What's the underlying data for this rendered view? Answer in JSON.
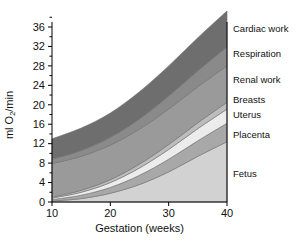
{
  "chart_data": {
    "type": "area",
    "title": "",
    "xlabel": "Gestation (weeks)",
    "ylabel": "ml O2/min",
    "ylabel_parts": {
      "pre": "ml O",
      "sub": "2",
      "post": "/min"
    },
    "x": [
      10,
      15,
      20,
      25,
      30,
      35,
      40
    ],
    "xlim": [
      10,
      40
    ],
    "ylim": [
      0,
      40
    ],
    "xticks": [
      10,
      20,
      30,
      40
    ],
    "xtick_labels": [
      "10",
      "20",
      "30",
      "40"
    ],
    "yticks": [
      0,
      4,
      8,
      12,
      16,
      20,
      24,
      28,
      32,
      36
    ],
    "ytick_labels": [
      "0",
      "4",
      "8",
      "12",
      "16",
      "20",
      "24",
      "28",
      "32",
      "36"
    ],
    "yminor_ticks": [
      2,
      6,
      10,
      14,
      18,
      22,
      26,
      30,
      34,
      38
    ],
    "grid": false,
    "legend_position": "right-outside",
    "stacked": true,
    "stack_order_bottom_to_top": [
      "Fetus",
      "Placenta",
      "Uterus",
      "Breasts",
      "Renal work",
      "Respiration",
      "Cardiac work"
    ],
    "series": [
      {
        "name": "Fetus",
        "color": "#d2d2d2",
        "label_y_value": 5.8,
        "values": [
          0.2,
          0.7,
          1.8,
          3.6,
          6.2,
          9.4,
          12.4
        ]
      },
      {
        "name": "Placenta",
        "color": "#a8a8a8",
        "label_y_value": 13.9,
        "values": [
          0.3,
          0.7,
          1.2,
          1.9,
          2.6,
          3.2,
          3.8
        ]
      },
      {
        "name": "Uterus",
        "color": "#ececec",
        "label_y_value": 18.0,
        "values": [
          0.3,
          0.6,
          1.0,
          1.5,
          2.0,
          2.5,
          2.9
        ]
      },
      {
        "name": "Breasts",
        "color": "#bdbdbd",
        "label_y_value": 21.1,
        "values": [
          0.2,
          0.4,
          0.6,
          0.8,
          1.0,
          1.2,
          1.4
        ]
      },
      {
        "name": "Renal work",
        "color": "#9a9a9a",
        "label_y_value": 25.1,
        "values": [
          6.9,
          7.0,
          7.1,
          7.2,
          7.3,
          7.4,
          7.5
        ]
      },
      {
        "name": "Respiration",
        "color": "#8a8a8a",
        "label_y_value": 30.6,
        "values": [
          0.9,
          1.2,
          1.6,
          2.1,
          2.7,
          3.3,
          3.9
        ]
      },
      {
        "name": "Cardiac work",
        "color": "#6e6e6e",
        "label_y_value": 35.6,
        "values": [
          4.2,
          4.6,
          5.0,
          5.6,
          6.2,
          6.8,
          7.4
        ]
      }
    ],
    "totals": [
      13.0,
      15.2,
      18.3,
      22.7,
      28.0,
      33.8,
      39.3
    ],
    "legend_entries": [
      {
        "label": "Cardiac work"
      },
      {
        "label": "Respiration"
      },
      {
        "label": "Renal work"
      },
      {
        "label": "Breasts"
      },
      {
        "label": "Uterus"
      },
      {
        "label": "Placenta"
      },
      {
        "label": "Fetus"
      }
    ]
  },
  "colors": {
    "axis": "#000000",
    "text": "#111111",
    "background": "#ffffff",
    "band_edge": "#6f6f6f"
  }
}
